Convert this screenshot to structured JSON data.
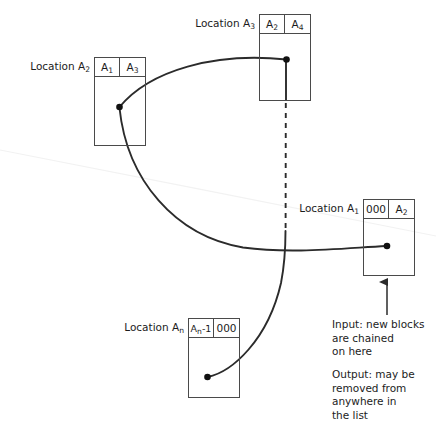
{
  "diagram": {
    "stroke_color": "#2b2b2b",
    "box_border_color": "#4a4a4a",
    "background": "#ffffff"
  },
  "blocks": [
    {
      "id": "a2",
      "label": "Location A",
      "label_sub": "2",
      "cell_left": "A",
      "cell_left_sub": "1",
      "cell_right": "A",
      "cell_right_sub": "3"
    },
    {
      "id": "a3",
      "label": "Location A",
      "label_sub": "3",
      "cell_left": "A",
      "cell_left_sub": "2",
      "cell_right": "A",
      "cell_right_sub": "4"
    },
    {
      "id": "a1",
      "label": "Location A",
      "label_sub": "1",
      "cell_left": "000",
      "cell_left_sub": "",
      "cell_right": "A",
      "cell_right_sub": "2"
    },
    {
      "id": "an",
      "label": "Location A",
      "label_sub": "n",
      "cell_left": "A",
      "cell_left_sub": "n",
      "cell_left_tail": "-1",
      "cell_right": "000",
      "cell_right_sub": ""
    }
  ],
  "notes": {
    "input": "Input: new blocks\nare chained\non here",
    "output": "Output: may be\nremoved from\nanywhere in\nthe list"
  }
}
